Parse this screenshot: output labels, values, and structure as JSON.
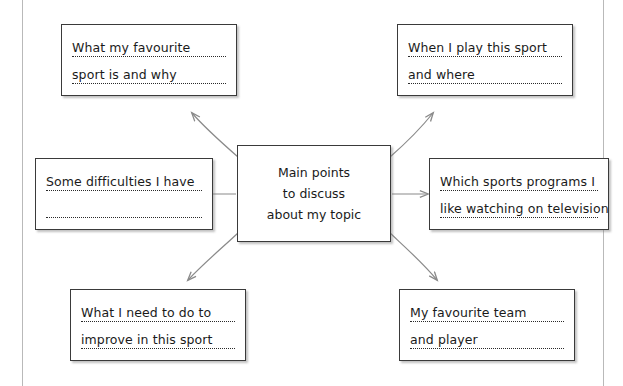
{
  "diagram": {
    "type": "mind-map",
    "title_node": {
      "name": "main-topic",
      "lines": [
        "Main points",
        "to discuss",
        "about my topic"
      ]
    },
    "branches": [
      {
        "id": "favourite-sport",
        "position": "top-left",
        "lines": [
          "What my favourite",
          "sport is and why"
        ],
        "arrow": "curved-up-left"
      },
      {
        "id": "when-where-play",
        "position": "top-right",
        "lines": [
          "When I play this sport",
          "and where"
        ],
        "arrow": "curved-up-right"
      },
      {
        "id": "difficulties",
        "position": "middle-left",
        "lines": [
          "Some difficulties I have",
          ""
        ],
        "arrow": "straight-left"
      },
      {
        "id": "sports-programs-tv",
        "position": "middle-right",
        "lines": [
          "Which sports programs I",
          "like watching on television"
        ],
        "arrow": "straight-right"
      },
      {
        "id": "improve-in-sport",
        "position": "bottom-left",
        "lines": [
          "What I need to do to",
          "improve in this sport"
        ],
        "arrow": "curved-down-left"
      },
      {
        "id": "favourite-team-player",
        "position": "bottom-right",
        "lines": [
          "My favourite team",
          "and player"
        ],
        "arrow": "curved-down-right"
      }
    ],
    "colors": {
      "box_border": "#3a3a3a",
      "arrow": "#8a8a8a",
      "text": "#1a1a1a",
      "rule": "#b9b9b9",
      "background": "#ffffff"
    }
  }
}
